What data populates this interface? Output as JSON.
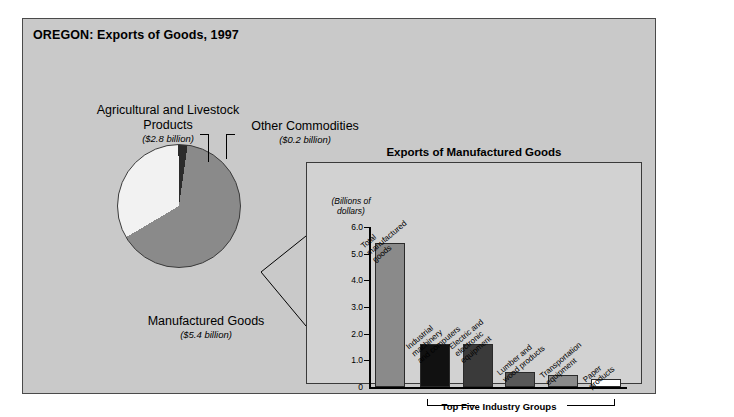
{
  "figure": {
    "title": "OREGON: Exports of Goods, 1997",
    "background_color": "#c9c9c9"
  },
  "pie": {
    "labels": {
      "agricultural": {
        "title": "Agricultural and Livestock Products",
        "amount": "($2.8 billion)"
      },
      "other": {
        "title": "Other Commodities",
        "amount": "($0.2 billion)"
      },
      "manufactured": {
        "title": "Manufactured Goods",
        "amount": "($5.4 billion)"
      }
    }
  },
  "inset": {
    "title": "Exports of Manufactured Goods",
    "axis_unit_line1": "(Billions of",
    "axis_unit_line2": "dollars)",
    "bracket_label": "Top Five Industry Groups"
  },
  "chart_data": [
    {
      "type": "pie",
      "title": "OREGON: Exports of Goods, 1997",
      "unit": "billions of dollars",
      "labels": [
        "Manufactured Goods",
        "Agricultural and Livestock Products",
        "Other Commodities"
      ],
      "values": [
        5.4,
        2.8,
        0.2
      ],
      "value_labels": [
        "($5.4 billion)",
        "($2.8 billion)",
        "($0.2 billion)"
      ],
      "colors": [
        "#8a8a8a",
        "#f2f2f2",
        "#2b2b2b"
      ],
      "legend": "labels placed around pie with leader lines"
    },
    {
      "type": "bar",
      "title": "Exports of Manufactured Goods",
      "ylabel": "(Billions of dollars)",
      "xlabel": "",
      "ylim": [
        0,
        6.0
      ],
      "yticks": [
        "0",
        "1.0",
        "2.0",
        "3.0",
        "4.0",
        "5.0",
        "6.0"
      ],
      "ytick_values": [
        0,
        1.0,
        2.0,
        3.0,
        4.0,
        5.0,
        6.0
      ],
      "grid": false,
      "categories": [
        "Total manufactured goods",
        "Industrial machinery and computers",
        "Electric and electronic equipment",
        "Lumber and wood products",
        "Transportation equipment",
        "Paper products"
      ],
      "values": [
        5.4,
        1.6,
        1.6,
        0.55,
        0.45,
        0.3
      ],
      "bar_colors": [
        "#8a8a8a",
        "#111111",
        "#3a3a3a",
        "#585858",
        "#8a8a8a",
        "#ffffff"
      ],
      "annotation": "Top Five Industry Groups"
    }
  ],
  "bars": [
    {
      "label_line1": "Total",
      "label_line2": "manufactured",
      "label_line3": "goods",
      "value": 5.4,
      "color": "#8a8a8a"
    },
    {
      "label_line1": "Industrial",
      "label_line2": "machinery",
      "label_line3": "and computers",
      "value": 1.6,
      "color": "#111111"
    },
    {
      "label_line1": "Electric and",
      "label_line2": "electronic",
      "label_line3": "equipment",
      "value": 1.6,
      "color": "#3a3a3a"
    },
    {
      "label_line1": "Lumber and",
      "label_line2": "wood products",
      "label_line3": "",
      "value": 0.55,
      "color": "#585858"
    },
    {
      "label_line1": "Transportation",
      "label_line2": "equipment",
      "label_line3": "",
      "value": 0.45,
      "color": "#8a8a8a"
    },
    {
      "label_line1": "Paper",
      "label_line2": "products",
      "label_line3": "",
      "value": 0.3,
      "color": "#ffffff"
    }
  ],
  "yticks": [
    {
      "label": "6.0",
      "value": 6.0
    },
    {
      "label": "5.0",
      "value": 5.0
    },
    {
      "label": "4.0",
      "value": 4.0
    },
    {
      "label": "3.0",
      "value": 3.0
    },
    {
      "label": "2.0",
      "value": 2.0
    },
    {
      "label": "1.0",
      "value": 1.0
    },
    {
      "label": "0",
      "value": 0
    }
  ]
}
